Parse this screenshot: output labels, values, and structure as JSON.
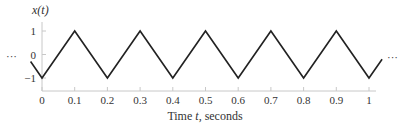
{
  "chart_data": {
    "type": "line",
    "title": "",
    "ylabel": "x(t)",
    "xlabel": "Time t, seconds",
    "xlabel_parts": [
      "Time ",
      "t",
      ", seconds"
    ],
    "x_ticks": [
      "0",
      "0.1",
      "0.2",
      "0.3",
      "0.4",
      "0.5",
      "0.6",
      "0.7",
      "0.8",
      "0.9",
      "1"
    ],
    "y_ticks": [
      "1",
      "0",
      "−1"
    ],
    "xlim": [
      0,
      1
    ],
    "ylim": [
      -1,
      1
    ],
    "grid": false,
    "legend": null,
    "series": [
      {
        "name": "x(t) triangle wave",
        "x": [
          -0.035,
          0,
          0.1,
          0.2,
          0.3,
          0.4,
          0.5,
          0.6,
          0.7,
          0.8,
          0.9,
          1.0,
          1.04
        ],
        "y": [
          -0.3,
          -1,
          1,
          -1,
          1,
          -1,
          1,
          -1,
          1,
          -1,
          1,
          -1,
          -0.2
        ]
      }
    ],
    "annotations": {
      "left_ellipsis": "···",
      "right_ellipsis": "···"
    },
    "period_seconds": 0.2,
    "amplitude": 1
  }
}
